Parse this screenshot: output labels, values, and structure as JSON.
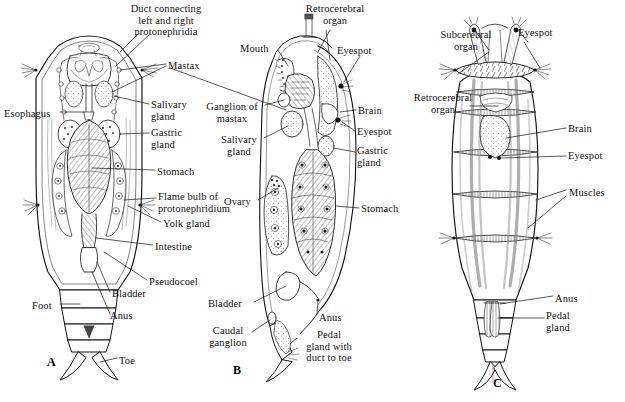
{
  "figure": {
    "kind": "anatomical-plate",
    "background_color": "#ffffff",
    "ink_color": "#111111",
    "caption": "Figure 15-1"
  },
  "panels": [
    {
      "id": "A",
      "plate_label": "A",
      "view": "dorsal whole mount"
    },
    {
      "id": "B",
      "plate_label": "B",
      "view": "lateral section"
    },
    {
      "id": "C",
      "plate_label": "C",
      "view": "musculature"
    }
  ],
  "labels": {
    "panel_a": [
      {
        "name": "duct-connecting-protonephridia",
        "text": "Duct connecting\nleft and right\nprotonephridia",
        "x": 116,
        "y": 3,
        "align": "ctr",
        "w": 100
      },
      {
        "name": "esophagus",
        "text": "Esophagus",
        "x": 4,
        "y": 108,
        "align": "left",
        "w": 56
      },
      {
        "name": "foot",
        "text": "Foot",
        "x": 32,
        "y": 300,
        "align": "left",
        "w": 28
      },
      {
        "name": "anus-a",
        "text": "Anus",
        "x": 110,
        "y": 310,
        "align": "left",
        "w": 32
      },
      {
        "name": "toe",
        "text": "Toe",
        "x": 119,
        "y": 355,
        "align": "left",
        "w": 26
      }
    ],
    "center_column": [
      {
        "name": "mastax",
        "text": "Mastax",
        "x": 168,
        "y": 60,
        "align": "left",
        "w": 46
      },
      {
        "name": "salivary-gland-a",
        "text": "Salivary\ngland",
        "x": 151,
        "y": 99,
        "align": "left",
        "w": 50
      },
      {
        "name": "gastric-gland-a",
        "text": "Gastric\ngland",
        "x": 151,
        "y": 127,
        "align": "left",
        "w": 50
      },
      {
        "name": "stomach-a",
        "text": "Stomach",
        "x": 157,
        "y": 166,
        "align": "left",
        "w": 52
      },
      {
        "name": "flame-bulb-of-protonephridium",
        "text": "Flame bulb of\nprotonephridium",
        "x": 158,
        "y": 191,
        "align": "left",
        "w": 90
      },
      {
        "name": "yolk-gland",
        "text": "Yolk gland",
        "x": 163,
        "y": 218,
        "align": "left",
        "w": 58
      },
      {
        "name": "intestine",
        "text": "Intestine",
        "x": 155,
        "y": 241,
        "align": "left",
        "w": 50
      },
      {
        "name": "pseudocoel",
        "text": "Pseudocoel",
        "x": 149,
        "y": 276,
        "align": "left",
        "w": 62
      },
      {
        "name": "bladder-a",
        "text": "Bladder",
        "x": 112,
        "y": 288,
        "align": "left",
        "w": 46
      }
    ],
    "panel_b": [
      {
        "name": "retrocerebral-organ-b",
        "text": "Retrocerebral\norgan",
        "x": 296,
        "y": 3,
        "align": "ctr",
        "w": 78
      },
      {
        "name": "mouth",
        "text": "Mouth",
        "x": 240,
        "y": 43,
        "align": "left",
        "w": 40
      },
      {
        "name": "eyespot-b1",
        "text": "Eyespot",
        "x": 337,
        "y": 45,
        "align": "left",
        "w": 46
      },
      {
        "name": "ganglion-of-mastax",
        "text": "Ganglion of\nmastax",
        "x": 199,
        "y": 101,
        "align": "ctr",
        "w": 66
      },
      {
        "name": "brain-b",
        "text": "Brain",
        "x": 358,
        "y": 105,
        "align": "left",
        "w": 34
      },
      {
        "name": "salivary-gland-b",
        "text": "Salivary\ngland",
        "x": 214,
        "y": 134,
        "align": "ctr",
        "w": 50
      },
      {
        "name": "eyespot-b2",
        "text": "Eyespot",
        "x": 357,
        "y": 126,
        "align": "left",
        "w": 46
      },
      {
        "name": "gastric-gland-b",
        "text": "Gastric\ngland",
        "x": 357,
        "y": 145,
        "align": "left",
        "w": 50
      },
      {
        "name": "ovary",
        "text": "Ovary",
        "x": 224,
        "y": 196,
        "align": "left",
        "w": 36
      },
      {
        "name": "stomach-b",
        "text": "Stomach",
        "x": 361,
        "y": 203,
        "align": "left",
        "w": 52
      },
      {
        "name": "bladder-b",
        "text": "Bladder",
        "x": 208,
        "y": 298,
        "align": "left",
        "w": 46
      },
      {
        "name": "anus-b",
        "text": "Anus",
        "x": 319,
        "y": 312,
        "align": "left",
        "w": 32
      },
      {
        "name": "caudal-ganglion",
        "text": "Caudal\nganglion",
        "x": 203,
        "y": 325,
        "align": "ctr",
        "w": 50
      },
      {
        "name": "pedal-gland-with-duct-to-toe",
        "text": "Pedal\ngland with\nduct to toe",
        "x": 299,
        "y": 329,
        "align": "ctr",
        "w": 60
      }
    ],
    "panel_c": [
      {
        "name": "subcerebral-organ",
        "text": "Subcerebral\norgan",
        "x": 431,
        "y": 29,
        "align": "ctr",
        "w": 70
      },
      {
        "name": "eyespot-c1",
        "text": "Eyespot",
        "x": 518,
        "y": 27,
        "align": "left",
        "w": 46
      },
      {
        "name": "retrocerebral-organ-c",
        "text": "Retrocerebral\norgan",
        "x": 404,
        "y": 92,
        "align": "ctr",
        "w": 78
      },
      {
        "name": "brain-c",
        "text": "Brain",
        "x": 568,
        "y": 123,
        "align": "left",
        "w": 34
      },
      {
        "name": "eyespot-c2",
        "text": "Eyespot",
        "x": 568,
        "y": 150,
        "align": "left",
        "w": 46
      },
      {
        "name": "muscles",
        "text": "Muscles",
        "x": 569,
        "y": 187,
        "align": "left",
        "w": 50
      },
      {
        "name": "anus-c",
        "text": "Anus",
        "x": 555,
        "y": 293,
        "align": "left",
        "w": 32
      },
      {
        "name": "pedal-gland-c",
        "text": "Pedal\ngland",
        "x": 546,
        "y": 310,
        "align": "left",
        "w": 40
      }
    ]
  },
  "plate_letters": [
    {
      "name": "plate-letter-a",
      "text": "A",
      "x": 47,
      "y": 355
    },
    {
      "name": "plate-letter-b",
      "text": "B",
      "x": 233,
      "y": 363
    },
    {
      "name": "plate-letter-c",
      "text": "C",
      "x": 493,
      "y": 376
    }
  ]
}
